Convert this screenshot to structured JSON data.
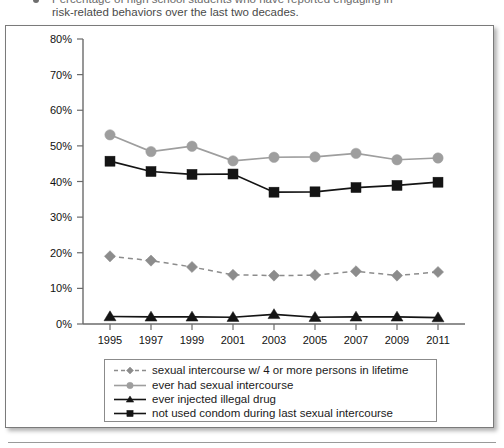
{
  "caption": {
    "line1": "Percentage of high school students who have reported engaging in",
    "line2": "risk-related behaviors over the last two decades.",
    "bullet_icon": "bullet-dot-icon"
  },
  "colors": {
    "gray_series": "#8c8c8c",
    "light_gray_series": "#9e9e9e",
    "black_series": "#141414",
    "axis": "#6b6b6b",
    "frame_border": "#7a7a7a",
    "legend_border": "#8b8b8b",
    "background": "#ffffff"
  },
  "chart_data": {
    "type": "line",
    "title": "",
    "subtitle": "",
    "xlabel": "",
    "ylabel": "",
    "x": [
      1995,
      1997,
      1999,
      2001,
      2003,
      2005,
      2007,
      2009,
      2011
    ],
    "categories": [
      "1995",
      "1997",
      "1999",
      "2001",
      "2003",
      "2005",
      "2007",
      "2009",
      "2011"
    ],
    "xtick_labels": [
      "1995",
      "1997",
      "1999",
      "2001",
      "2003",
      "2005",
      "2007",
      "2009",
      "2011"
    ],
    "ytick_labels": [
      "0%",
      "10%",
      "20%",
      "30%",
      "40%",
      "50%",
      "60%",
      "70%",
      "80%"
    ],
    "ytick_values": [
      0,
      10,
      20,
      30,
      40,
      50,
      60,
      70,
      80
    ],
    "ylim": [
      0,
      80
    ],
    "xlim": [
      1995,
      2011
    ],
    "grid": false,
    "legend_position": "bottom",
    "value_suffix": "%",
    "series": [
      {
        "name": "sexual intercourse w/ 4 or more persons in lifetime",
        "marker": "diamond",
        "line_style": "dashed",
        "color": "#8c8c8c",
        "values": [
          19.0,
          17.8,
          16.0,
          13.8,
          13.6,
          13.7,
          14.8,
          13.6,
          14.6
        ]
      },
      {
        "name": "ever had sexual intercourse",
        "marker": "circle",
        "line_style": "solid",
        "color": "#9e9e9e",
        "values": [
          53.1,
          48.4,
          49.9,
          45.8,
          46.8,
          46.9,
          47.9,
          46.1,
          46.6
        ]
      },
      {
        "name": "ever injected illegal drug",
        "marker": "triangle",
        "line_style": "solid",
        "color": "#141414",
        "values": [
          2.1,
          2.0,
          2.0,
          1.9,
          2.7,
          1.9,
          2.0,
          2.0,
          1.8
        ]
      },
      {
        "name": "not used condom during last sexual intercourse",
        "marker": "square",
        "line_style": "solid",
        "color": "#141414",
        "values": [
          45.7,
          42.8,
          42.0,
          42.1,
          37.0,
          37.1,
          38.3,
          38.9,
          39.8
        ]
      }
    ]
  },
  "legend": {
    "items": [
      {
        "label": "sexual intercourse w/ 4 or more persons in lifetime",
        "marker": "diamond",
        "line_style": "dashed",
        "color": "#8c8c8c"
      },
      {
        "label": "ever had sexual intercourse",
        "marker": "circle",
        "line_style": "solid",
        "color": "#9e9e9e"
      },
      {
        "label": "ever injected illegal drug",
        "marker": "triangle",
        "line_style": "solid",
        "color": "#141414"
      },
      {
        "label": "not used condom during last sexual intercourse",
        "marker": "square",
        "line_style": "solid",
        "color": "#141414"
      }
    ]
  }
}
